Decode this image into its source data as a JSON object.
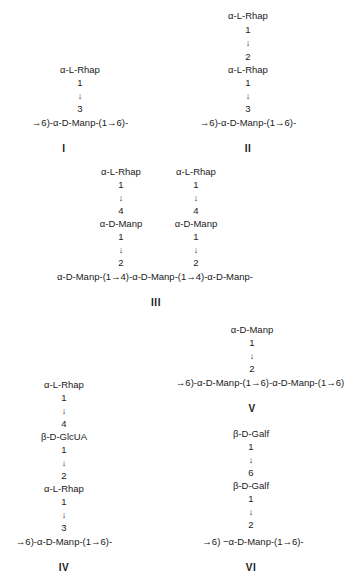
{
  "figure": {
    "structures": [
      {
        "label": "I",
        "side_chain": [
          "α-L-Rhap",
          "1",
          "↓",
          "3"
        ],
        "backbone": "→6)-α-D-Manp-(1→6)-"
      },
      {
        "label": "II",
        "side_chain": [
          "α-L-Rhap",
          "1",
          "↓",
          "2",
          "α-L-Rhap",
          "1",
          "↓",
          "3"
        ],
        "backbone": "→6)-α-D-Manp-(1→6)-"
      },
      {
        "label": "III",
        "side_chains": [
          [
            "α-L-Rhap",
            "1",
            "↓",
            "4",
            "α-D-Manp",
            "1",
            "↓",
            "2"
          ],
          [
            "α-L-Rhap",
            "1",
            "↓",
            "4",
            "α-D-Manp",
            "1",
            "↓",
            "2"
          ]
        ],
        "backbone": "α-D-Manp-(1→4)-α-D-Manp-(1→4)-α-D-Manp-"
      },
      {
        "label": "IV",
        "side_chain": [
          "α-L-Rhap",
          "1",
          "↓",
          "4",
          "β-D-GlcUA",
          "1",
          "↓",
          "2",
          "α-L-Rhap",
          "1",
          "↓",
          "3"
        ],
        "backbone": "→6)-α-D-Manp-(1→6)-"
      },
      {
        "label": "V",
        "side_chain": [
          "α-D-Manp",
          "1",
          "↓",
          "2"
        ],
        "backbone": "→6)-α-D-Manp-(1→6)-α-D-Manp-(1→6)"
      },
      {
        "label": "VI",
        "side_chain": [
          "β-D-Galf",
          "1",
          "↓",
          "6",
          "β-D-Galf",
          "1",
          "↓",
          "2"
        ],
        "backbone": "→6) −α-D-Manp-(1→6)-"
      }
    ]
  }
}
